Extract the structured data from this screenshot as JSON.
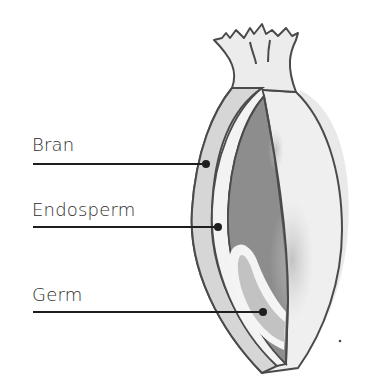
{
  "diagram": {
    "labels": [
      {
        "id": "bran",
        "text": "Bran",
        "x": 32,
        "y": 133,
        "line_y": 164,
        "dot_x": 206
      },
      {
        "id": "endosperm",
        "text": "Endosperm",
        "x": 32,
        "y": 198,
        "line_y": 227,
        "dot_x": 218
      },
      {
        "id": "germ",
        "text": "Germ",
        "x": 32,
        "y": 283,
        "line_y": 312,
        "dot_x": 263
      }
    ],
    "colors": {
      "outline": "#4a4a4a",
      "bran_fill": "#d8d8d8",
      "husk_fill": "#ececec",
      "endosperm_fill": "#8a8a8a",
      "germ_fill": "#b9b9b9",
      "leader_line": "#1e1e1e"
    }
  }
}
